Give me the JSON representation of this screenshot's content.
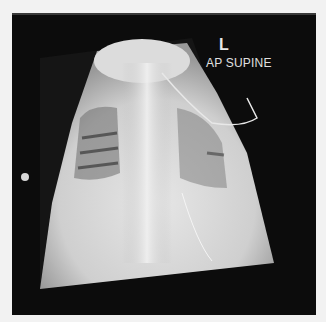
{
  "image": {
    "type": "chest radiograph",
    "header_strip_text": "",
    "annotations": {
      "side_marker": "L",
      "projection": "AP SUPINE"
    }
  }
}
